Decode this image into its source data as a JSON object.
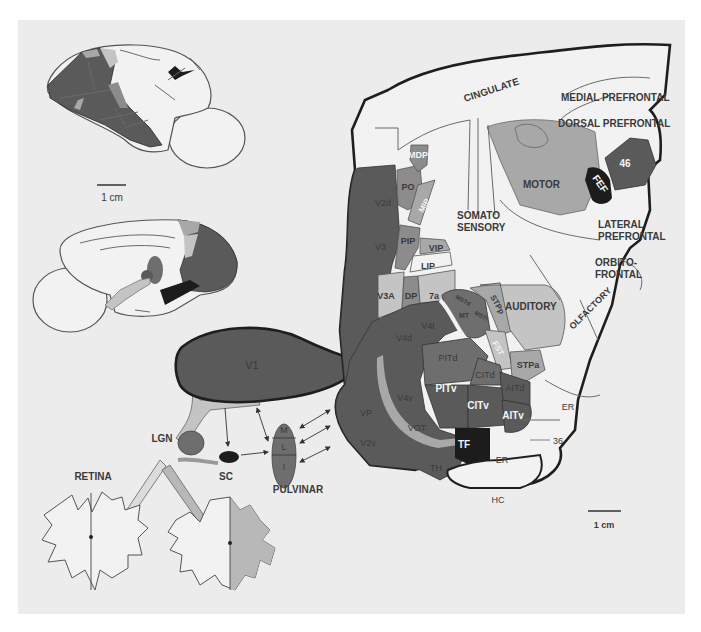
{
  "figure": {
    "type": "anatomical diagram",
    "colors": {
      "background_panel": "#ececec",
      "darkest": "#1c1c1c",
      "dark_visual": "#5a5a5a",
      "mid_dark": "#6e6e6e",
      "mid": "#8c8c8c",
      "light_mid": "#a8a8a8",
      "light": "#c4c4c4",
      "unshaded": "#f2f2f2",
      "outline": "#1e1e1e"
    }
  },
  "lateral_view": {
    "scale_bar_label": "1 cm"
  },
  "medial_view": {},
  "subcortical": {
    "v1": "V1",
    "lgn": "LGN",
    "sc": "SC",
    "pulvinar": "PULVINAR",
    "pulvinar_divisions": [
      "M",
      "L",
      "I"
    ],
    "retina": "RETINA"
  },
  "flat_map": {
    "scale_bar_label": "1 cm",
    "regions": {
      "cingulate": "CINGULATE",
      "medial_prefrontal": "MEDIAL PREFRONTAL",
      "dorsal_prefrontal": "DORSAL PREFRONTAL",
      "area46": "46",
      "fef": "FEF",
      "motor": "MOTOR",
      "somato1": "SOMATO",
      "somato2": "SENSORY",
      "lateral_pf1": "LATERAL",
      "lateral_pf2": "PREFRONTAL",
      "orbito1": "ORBITO-",
      "orbito2": "FRONTAL",
      "olfactory": "OLFACTORY",
      "auditory": "AUDITORY",
      "mdp": "MDP",
      "po": "PO",
      "mip": "MIP",
      "v2d": "V2d",
      "v3": "V3",
      "pip": "PIP",
      "vip": "VIP",
      "lip": "LIP",
      "v3a": "V3A",
      "dp": "DP",
      "a7a": "7a",
      "mstd": "MSTd",
      "mstl": "MSTl",
      "mt": "MT",
      "stpp": "STPp",
      "fst": "FST",
      "stpa": "STPa",
      "v4t": "V4t",
      "v4d": "V4d",
      "pitd": "PITd",
      "citd": "CITd",
      "aitd": "AITd",
      "pitv": "PITv",
      "citv": "CITv",
      "aitv": "AITv",
      "v4v": "V4v",
      "vot": "VOT",
      "vp": "VP",
      "v2v": "V2v",
      "tf": "TF",
      "th": "TH",
      "er": "ER",
      "er_outer": "ER",
      "area36": "36",
      "hc": "HC"
    }
  }
}
